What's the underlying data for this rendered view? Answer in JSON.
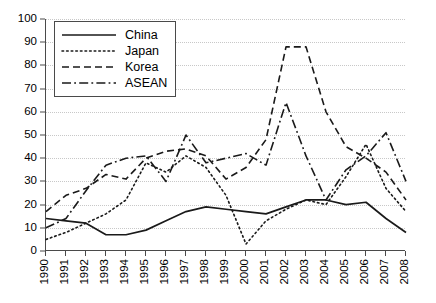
{
  "chart_data": {
    "type": "line",
    "title": "",
    "xlabel": "",
    "ylabel": "",
    "grid": true,
    "legend_position": "top-left",
    "xlim": [
      1990,
      2008
    ],
    "ylim": [
      0,
      100
    ],
    "ytick_step": 10,
    "categories": [
      "1990",
      "1991",
      "1992",
      "1993",
      "1994",
      "1995",
      "1996",
      "1997",
      "1998",
      "1999",
      "2000",
      "2001",
      "2002",
      "2003",
      "2004",
      "2005",
      "2006",
      "2007",
      "2008"
    ],
    "x": [
      1990,
      1991,
      1992,
      1993,
      1994,
      1995,
      1996,
      1997,
      1998,
      1999,
      2000,
      2001,
      2002,
      2003,
      2004,
      2005,
      2006,
      2007,
      2008
    ],
    "ytick_labels": [
      "0",
      "10",
      "20",
      "30",
      "40",
      "50",
      "60",
      "70",
      "80",
      "90",
      "100"
    ],
    "series": [
      {
        "name": "China",
        "style": "solid",
        "color": "#1a1a1a",
        "values": [
          14,
          13,
          12,
          7,
          7,
          9,
          13,
          17,
          19,
          18,
          17,
          16,
          19,
          22,
          22,
          20,
          21,
          14,
          8
        ]
      },
      {
        "name": "Japan",
        "style": "dotted",
        "color": "#1a1a1a",
        "values": [
          5,
          8,
          12,
          16,
          22,
          38,
          34,
          41,
          36,
          24,
          3,
          13,
          18,
          22,
          20,
          32,
          46,
          27,
          17
        ]
      },
      {
        "name": "Korea",
        "style": "dashed",
        "color": "#1a1a1a",
        "values": [
          17,
          24,
          27,
          33,
          31,
          40,
          43,
          44,
          41,
          31,
          36,
          48,
          88,
          88,
          60,
          45,
          40,
          34,
          22
        ]
      },
      {
        "name": "ASEAN",
        "style": "dashdot",
        "color": "#1a1a1a",
        "values": [
          10,
          14,
          26,
          37,
          40,
          41,
          30,
          50,
          38,
          40,
          42,
          37,
          64,
          41,
          22,
          35,
          41,
          51,
          30
        ]
      }
    ]
  },
  "legend": {
    "items": [
      {
        "label": "China",
        "icon": "solid-line-icon"
      },
      {
        "label": "Japan",
        "icon": "dotted-line-icon"
      },
      {
        "label": "Korea",
        "icon": "dashed-line-icon"
      },
      {
        "label": "ASEAN",
        "icon": "dashdot-line-icon"
      }
    ]
  },
  "axis_colors": {
    "axis": "#4a4a4a",
    "grid": "#c8c8c8",
    "line": "#1a1a1a"
  }
}
